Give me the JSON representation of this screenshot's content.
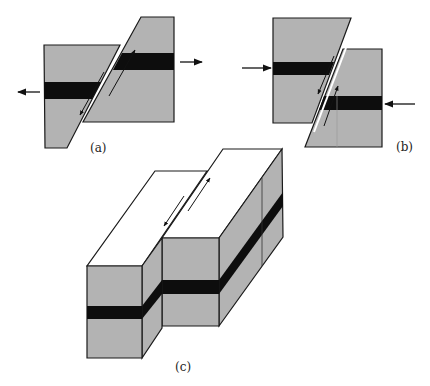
{
  "figure": {
    "colors": {
      "rock": "#b3b3b3",
      "band": "#0d0d0d",
      "outline": "#1a1a1a",
      "top_face": "#ffffff",
      "background": "#ffffff"
    },
    "panels": [
      {
        "id": "a",
        "label": "(a)",
        "description": "Block offset along oblique fault, extension arrows pointing outward"
      },
      {
        "id": "b",
        "label": "(b)",
        "description": "Block offset along oblique fault, compression arrows pointing inward"
      },
      {
        "id": "c",
        "label": "(c)",
        "description": "3D block diagram of strike-slip fault with offset black layer"
      }
    ]
  }
}
